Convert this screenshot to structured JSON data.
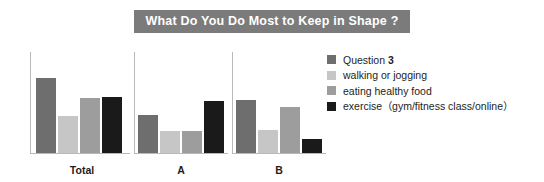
{
  "title": "What Do You Do Most to Keep in Shape ?",
  "title_bg": "#7b7b7b",
  "title_color": "#ffffff",
  "legend": {
    "items": [
      {
        "label": "Question 3",
        "color": "#6e6e6e"
      },
      {
        "label": "walking or jogging",
        "color": "#c6c6c6"
      },
      {
        "label": "eating healthy food",
        "color": "#9d9d9d"
      },
      {
        "label": "exercise（gym/fitness class/online）",
        "color": "#1a1a1a"
      }
    ]
  },
  "groups": [
    {
      "label": "Total"
    },
    {
      "label": "A"
    },
    {
      "label": "B"
    }
  ],
  "chart_data": {
    "type": "bar",
    "title": "What Do You Do Most to Keep in Shape ?",
    "xlabel": "",
    "ylabel": "",
    "ylim": [
      0,
      100
    ],
    "grid": false,
    "legend_position": "right",
    "categories": [
      "Total",
      "A",
      "B"
    ],
    "series": [
      {
        "name": "Question 3",
        "color": "#6e6e6e",
        "values": [
          75,
          38,
          53
        ]
      },
      {
        "name": "walking or jogging",
        "color": "#c6c6c6",
        "values": [
          37,
          22,
          23
        ]
      },
      {
        "name": "eating healthy food",
        "color": "#9d9d9d",
        "values": [
          55,
          22,
          46
        ]
      },
      {
        "name": "exercise（gym/fitness class/online）",
        "color": "#1a1a1a",
        "values": [
          56,
          52,
          14
        ]
      }
    ]
  }
}
